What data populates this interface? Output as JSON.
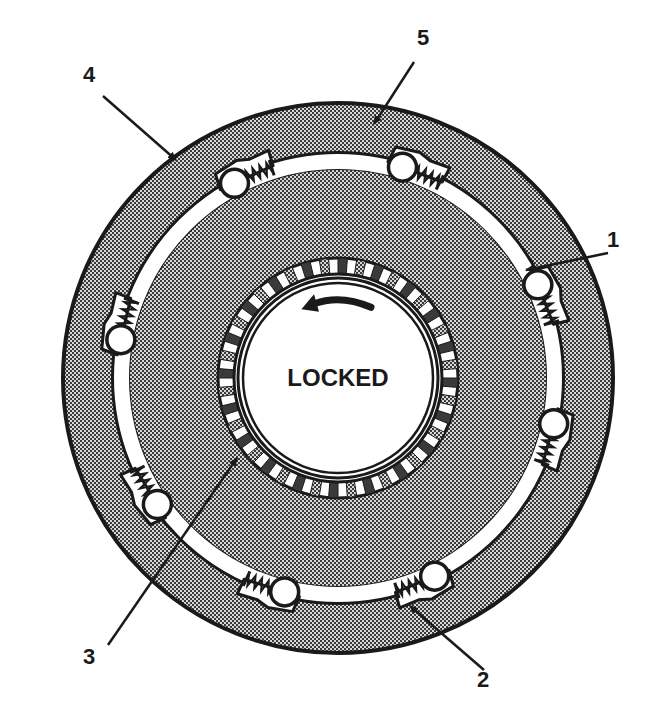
{
  "diagram": {
    "type": "roller-clutch-cross-section",
    "center_label": "LOCKED",
    "rotation_arrow": "counterclockwise",
    "colors": {
      "ink": "#1a1a1a",
      "paper": "#ffffff",
      "stipple_dark": "#3a3a3a",
      "stipple_light": "#d8d8d8"
    },
    "geometry": {
      "cx": 338,
      "cy": 378,
      "outer_race_r": 275,
      "groove_outer_r": 224,
      "groove_inner_r": 209,
      "teeth_outer_r": 120,
      "teeth_inner_r": 104,
      "hub_ring_r": 100,
      "hub_inner_r": 95,
      "roller_r": 14,
      "teeth_count": 40
    },
    "rollers": [
      {
        "angle": -118,
        "id": "roller-top-left"
      },
      {
        "angle": -73,
        "id": "roller-top-right"
      },
      {
        "angle": -25,
        "id": "roller-right-upper"
      },
      {
        "angle": 12,
        "id": "roller-right-lower"
      },
      {
        "angle": 64,
        "id": "roller-bottom-right"
      },
      {
        "angle": 104,
        "id": "roller-bottom-left"
      },
      {
        "angle": 145,
        "id": "roller-left-lower"
      },
      {
        "angle": 190,
        "id": "roller-left-upper"
      }
    ],
    "callouts": [
      {
        "label": "1",
        "text_x": 614,
        "text_y": 240,
        "from": [
          608,
          253
        ],
        "to": [
          526,
          270
        ]
      },
      {
        "label": "2",
        "text_x": 484,
        "text_y": 680,
        "from": [
          484,
          670
        ],
        "to": [
          410,
          606
        ]
      },
      {
        "label": "3",
        "text_x": 90,
        "text_y": 657,
        "from": [
          108,
          645
        ],
        "to": [
          237,
          458
        ]
      },
      {
        "label": "4",
        "text_x": 90,
        "text_y": 75,
        "from": [
          103,
          96
        ],
        "to": [
          176,
          160
        ]
      },
      {
        "label": "5",
        "text_x": 424,
        "text_y": 38,
        "from": [
          414,
          62
        ],
        "to": [
          374,
          124
        ]
      }
    ]
  }
}
